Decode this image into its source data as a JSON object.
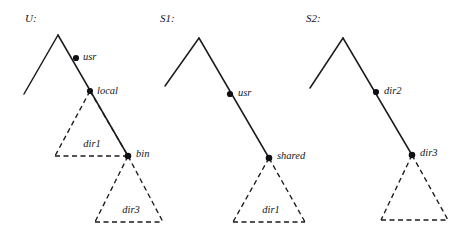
{
  "figure": {
    "background_color": "#ffffff",
    "ink_color": "#1b1b1f",
    "width": 468,
    "height": 231,
    "trees": [
      {
        "id": "U",
        "caption": "U:",
        "caption_pos": {
          "x": 25,
          "y": 22
        },
        "apex": {
          "x": 58,
          "y": 35
        },
        "left_leg_end": {
          "x": 24,
          "y": 94
        },
        "spine": [
          {
            "x": 58,
            "y": 35
          },
          {
            "x": 128,
            "y": 156
          }
        ],
        "nodes": [
          {
            "name": "usr",
            "label": "usr",
            "x": 76,
            "y": 58,
            "label_x": 83,
            "label_y": 60
          },
          {
            "name": "local",
            "label": "local",
            "x": 90,
            "y": 91,
            "label_x": 97,
            "label_y": 94
          },
          {
            "name": "bin",
            "label": "bin",
            "x": 128,
            "y": 156,
            "label_x": 136,
            "label_y": 157
          }
        ],
        "regions": [
          {
            "name": "dir1",
            "label": "dir1",
            "style": "dashed",
            "apex": {
              "x": 90,
              "y": 91
            },
            "base_left": {
              "x": 55,
              "y": 156
            },
            "base_right": {
              "x": 128,
              "y": 156
            },
            "label_x": 92,
            "label_y": 147
          },
          {
            "name": "dir3",
            "label": "dir3",
            "style": "dashed",
            "apex": {
              "x": 128,
              "y": 156
            },
            "base_left": {
              "x": 95,
              "y": 222
            },
            "base_right": {
              "x": 163,
              "y": 222
            },
            "label_x": 131,
            "label_y": 213
          }
        ]
      },
      {
        "id": "S1",
        "caption": "S1:",
        "caption_pos": {
          "x": 160,
          "y": 22
        },
        "apex": {
          "x": 199,
          "y": 38
        },
        "left_leg_end": {
          "x": 165,
          "y": 86
        },
        "spine": [
          {
            "x": 199,
            "y": 38
          },
          {
            "x": 269,
            "y": 158
          }
        ],
        "nodes": [
          {
            "name": "usr",
            "label": "usr",
            "x": 230,
            "y": 94,
            "label_x": 238,
            "label_y": 96
          },
          {
            "name": "shared",
            "label": "shared",
            "x": 269,
            "y": 158,
            "label_x": 277,
            "label_y": 159
          }
        ],
        "regions": [
          {
            "name": "dir1",
            "label": "dir1",
            "style": "dashed",
            "apex": {
              "x": 269,
              "y": 158
            },
            "base_left": {
              "x": 233,
              "y": 222
            },
            "base_right": {
              "x": 305,
              "y": 222
            },
            "label_x": 271,
            "label_y": 213
          }
        ]
      },
      {
        "id": "S2",
        "caption": "S2:",
        "caption_pos": {
          "x": 306,
          "y": 22
        },
        "apex": {
          "x": 343,
          "y": 38
        },
        "left_leg_end": {
          "x": 310,
          "y": 88
        },
        "spine": [
          {
            "x": 343,
            "y": 38
          },
          {
            "x": 412,
            "y": 155
          }
        ],
        "nodes": [
          {
            "name": "dir2",
            "label": "dir2",
            "x": 376,
            "y": 92,
            "label_x": 384,
            "label_y": 94
          },
          {
            "name": "dir3",
            "label": "dir3",
            "x": 412,
            "y": 155,
            "label_x": 420,
            "label_y": 156
          }
        ],
        "regions": [
          {
            "name": "dir3-subtree",
            "label": "",
            "style": "dashed",
            "apex": {
              "x": 412,
              "y": 155
            },
            "base_left": {
              "x": 381,
              "y": 220
            },
            "base_right": {
              "x": 448,
              "y": 220
            },
            "label_x": 414,
            "label_y": 211
          }
        ]
      }
    ]
  }
}
